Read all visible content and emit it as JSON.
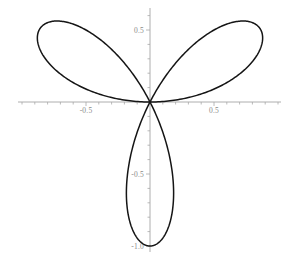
{
  "chart_data": {
    "type": "line",
    "title": "",
    "subtitle": "",
    "xlabel": "",
    "ylabel": "",
    "curve_name": "three-petal polar rose",
    "polar_equation": "r = cos(3*theta)",
    "petal_count": 3,
    "petal_tip_radius": 1.0,
    "petal_tip_angles_deg": [
      30,
      150,
      270
    ],
    "petal_tips_xy": [
      [
        0.866,
        0.5
      ],
      [
        -0.866,
        0.5
      ],
      [
        0.0,
        -1.0
      ]
    ],
    "xlim": [
      -1.03,
      1.03
    ],
    "ylim": [
      -1.05,
      0.62
    ],
    "grid": false,
    "legend": false,
    "legend_position": "none",
    "axes_style": "centered-cross-through-origin",
    "x_axis_tick_labels": [
      "-0.5",
      "0.5"
    ],
    "x_axis_tick_values": [
      -0.5,
      0.5
    ],
    "y_axis_tick_labels": [
      "0.5",
      "-0.5",
      "-1.0"
    ],
    "y_axis_tick_values": [
      0.5,
      -0.5,
      -1.0
    ],
    "x_minor_tick_step": 0.1,
    "y_minor_tick_step": 0.1,
    "x": [],
    "values": []
  },
  "style": {
    "curve_color": "#151515",
    "curve_width": 1.5,
    "axis_color": "#9a9a9a",
    "axis_width": 0.8,
    "tick_color": "#a8a8a8",
    "tick_label_color": "#8a8a8a",
    "background_color": "#ffffff"
  },
  "geometry": {
    "origin_x": 150,
    "origin_y": 102,
    "unit_x_px": 128,
    "unit_y_px": 144,
    "x_axis_left_px": 18,
    "x_axis_right_px": 281,
    "y_axis_top_px": 8,
    "y_axis_bottom_px": 252,
    "width": 297,
    "height": 255
  },
  "labels": {
    "x_neg_half": "-0.5",
    "x_pos_half": "0.5",
    "y_pos_half": "0.5",
    "y_neg_half": "-0.5",
    "y_neg_one": "-1.0"
  }
}
